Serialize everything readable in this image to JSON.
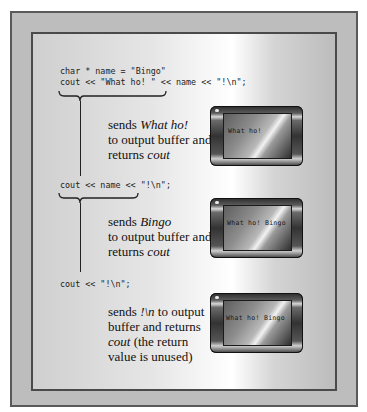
{
  "code": {
    "line1": "char * name = \"Bingo\"",
    "line2": "cout << \"What ho! \" << name << \"!\\n\";",
    "line3": "cout << name << \"!\\n\";",
    "line4": "cout << \"!\\n\";"
  },
  "steps": [
    {
      "desc_pre": "sends ",
      "desc_em": "What ho!",
      "desc_mid": "to output buffer and",
      "desc_post": "returns ",
      "desc_em2": "cout",
      "screen": "What ho!"
    },
    {
      "desc_pre": "sends ",
      "desc_em": "Bingo",
      "desc_mid": "to output buffer and",
      "desc_post": "returns ",
      "desc_em2": "cout",
      "screen": "What ho! Bingo"
    },
    {
      "desc_pre": "sends ",
      "desc_em": "!\\n",
      "desc_after_em": " to output",
      "desc_mid": "buffer and returns",
      "desc_em2": "cout",
      "desc_post2": " (the return",
      "desc_last": "value is unused)",
      "screen": "What ho! Bingo"
    }
  ],
  "colors": {
    "outer_frame": "#bdbdbd",
    "frame_border": "#4a4a4a",
    "text": "#111111"
  }
}
